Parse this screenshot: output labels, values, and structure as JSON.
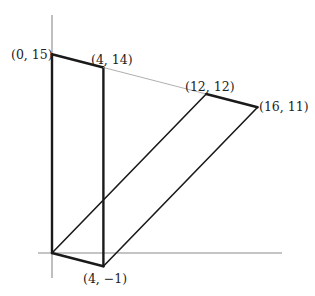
{
  "diagram": {
    "type": "coordinate-geometry",
    "axes": {
      "color": "#8a8a8a",
      "x_axis": {
        "from_px": 38,
        "to_px": 282,
        "y_px": 253
      },
      "y_axis": {
        "from_px": 15,
        "to_px": 278,
        "x_px": 52
      }
    },
    "scale": {
      "origin_px": [
        52,
        253
      ],
      "px_per_unit_x": 12.85,
      "px_per_unit_y": 13.25
    },
    "colors": {
      "shape": "#1a1a1a",
      "guide": "#9a9a9a"
    },
    "points": [
      {
        "id": "p0_15",
        "label": "(0, 15)",
        "x": 0,
        "y": 15
      },
      {
        "id": "p4_14",
        "label": "(4, 14)",
        "x": 4,
        "y": 14
      },
      {
        "id": "p12_12",
        "label": "(12, 12)",
        "x": 12,
        "y": 12
      },
      {
        "id": "p16_11",
        "label": "(16, 11)",
        "x": 16,
        "y": 11
      },
      {
        "id": "p4_m1",
        "label": "(4, −1)",
        "x": 4,
        "y": -1
      },
      {
        "id": "origin",
        "label": "",
        "x": 0,
        "y": 0
      }
    ],
    "segments": [
      {
        "name": "edge-top-left",
        "from": [
          0,
          15
        ],
        "to": [
          4,
          14
        ],
        "weight": "thick"
      },
      {
        "name": "edge-left-vertical",
        "from": [
          0,
          0
        ],
        "to": [
          0,
          15
        ],
        "weight": "thick"
      },
      {
        "name": "edge-right-vertical",
        "from": [
          4,
          -1
        ],
        "to": [
          4,
          14
        ],
        "weight": "thick"
      },
      {
        "name": "edge-bottom",
        "from": [
          0,
          0
        ],
        "to": [
          4,
          -1
        ],
        "weight": "thick"
      },
      {
        "name": "guide-line",
        "from": [
          4,
          14
        ],
        "to": [
          12,
          12
        ],
        "weight": "thin"
      },
      {
        "name": "edge-top-right",
        "from": [
          12,
          12
        ],
        "to": [
          16,
          11
        ],
        "weight": "thick"
      },
      {
        "name": "edge-diagonal-left",
        "from": [
          0,
          0
        ],
        "to": [
          12,
          12
        ],
        "weight": "medium"
      },
      {
        "name": "edge-diagonal-right",
        "from": [
          4,
          -1
        ],
        "to": [
          16,
          11
        ],
        "weight": "medium"
      }
    ],
    "labels": [
      {
        "name": "label-0-15",
        "text": "(0, 15)",
        "x_px": 11,
        "y_px": 59
      },
      {
        "name": "label-4-14",
        "text": "(4, 14)",
        "x_px": 91,
        "y_px": 64
      },
      {
        "name": "label-12-12",
        "text": "(12, 12)",
        "x_px": 185,
        "y_px": 91
      },
      {
        "name": "label-16-11",
        "text": "(16, 11)",
        "x_px": 259,
        "y_px": 111
      },
      {
        "name": "label-4-m1",
        "text": "(4, −1)",
        "x_px": 83,
        "y_px": 283
      }
    ]
  }
}
